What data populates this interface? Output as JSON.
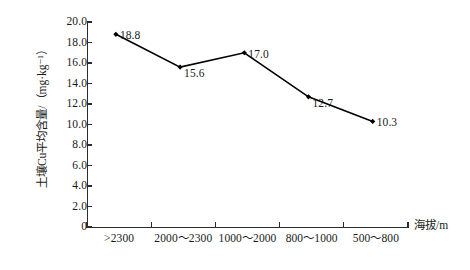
{
  "chart_data": {
    "type": "line",
    "title": "",
    "subtitle": "",
    "xlabel": "海拔/m",
    "ylabel": "土壤Cu平均含量/（mg·kg⁻¹）",
    "categories": [
      ">2300",
      "2000～2300",
      "1000～2000",
      "800～1000",
      "500～800"
    ],
    "values": [
      18.8,
      15.6,
      17.0,
      12.7,
      10.3
    ],
    "point_labels": [
      "18.8",
      "15.6",
      "17.0",
      "12.7",
      "10.3"
    ],
    "ylim": [
      0,
      20
    ],
    "yticks": [
      0,
      2.0,
      4.0,
      6.0,
      8.0,
      10.0,
      12.0,
      14.0,
      16.0,
      18.0,
      20.0
    ],
    "ytick_labels": [
      "0",
      "2.0",
      "4.0",
      "6.0",
      "8.0",
      "10.0",
      "12.0",
      "14.0",
      "16.0",
      "18.0",
      "20.0"
    ],
    "grid": false,
    "legend": false,
    "legend_position": "none",
    "series": [
      {
        "name": "土壤Cu平均含量",
        "values": [
          18.8,
          15.6,
          17.0,
          12.7,
          10.3
        ],
        "color": "#000000",
        "marker": "diamond",
        "line_style": "solid"
      }
    ],
    "colors": {
      "line": "#000000",
      "marker": "#000000",
      "axis": "#2b2b2b",
      "text": "#1a1a1a",
      "background": "#ffffff"
    }
  }
}
